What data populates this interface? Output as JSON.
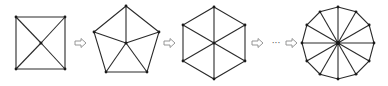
{
  "diagram": {
    "shapes": [
      {
        "name": "square",
        "sides": 4,
        "center": [
          41,
          43
        ],
        "vertices": [
          [
            16,
            17
          ],
          [
            65,
            17
          ],
          [
            65,
            69
          ],
          [
            16,
            69
          ]
        ]
      },
      {
        "name": "pentagon",
        "sides": 5,
        "center": [
          126,
          43
        ],
        "vertices": [
          [
            126,
            6
          ],
          [
            159,
            32
          ],
          [
            147,
            72
          ],
          [
            106,
            72
          ],
          [
            94,
            32
          ]
        ]
      },
      {
        "name": "hexagon",
        "sides": 6,
        "center": [
          214,
          43
        ],
        "vertices": [
          [
            214,
            7
          ],
          [
            245,
            25
          ],
          [
            245,
            61
          ],
          [
            214,
            79
          ],
          [
            183,
            61
          ],
          [
            183,
            25
          ]
        ]
      },
      {
        "name": "dodecagon",
        "sides": 12,
        "center": [
          338,
          43
        ],
        "radius": 36
      }
    ],
    "arrows": [
      {
        "x": 75,
        "y": 43
      },
      {
        "x": 164,
        "y": 43
      },
      {
        "x": 252,
        "y": 43
      },
      {
        "x": 286,
        "y": 43
      }
    ],
    "ellipsis": {
      "text": "···",
      "x": 276,
      "y": 46
    },
    "colors": {
      "edge": "#2a2a2a",
      "vertex": "#1a1a1a",
      "arrow": "#8a8a8a"
    }
  }
}
